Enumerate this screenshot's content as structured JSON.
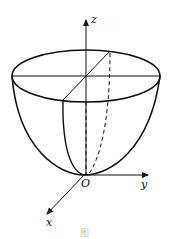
{
  "figure": {
    "stroke_color": "#111111",
    "axes": {
      "z_label": "z",
      "y_label": "y",
      "x_label": "x",
      "origin_label": "O"
    },
    "caption": "图"
  }
}
